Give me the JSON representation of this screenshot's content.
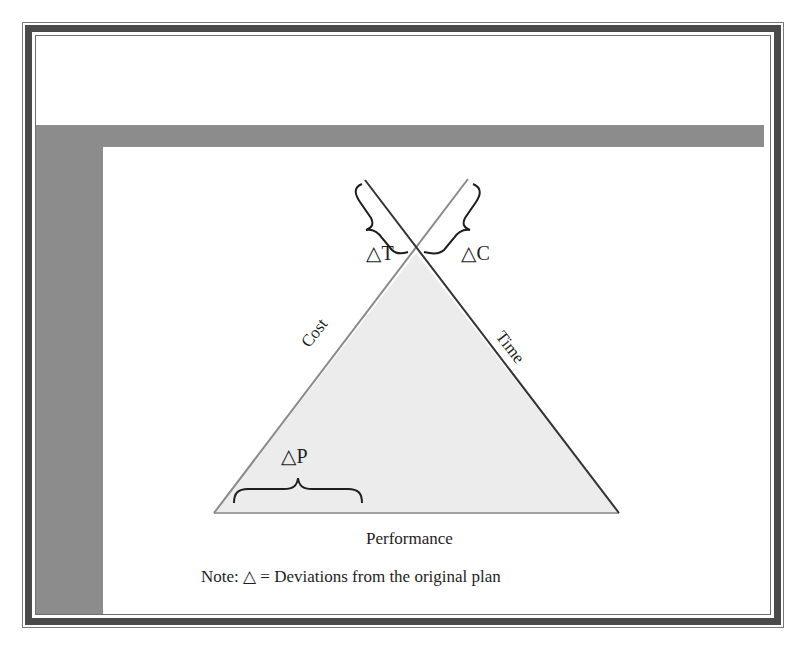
{
  "diagram": {
    "type": "project-triangle",
    "sides": {
      "left": "Cost",
      "right": "Time",
      "base": "Performance"
    },
    "deviations": {
      "time": "△T",
      "cost": "△C",
      "performance": "△P"
    },
    "note": "Note: △ = Deviations from the original plan",
    "colors": {
      "frame_dark": "#4a4a4a",
      "band_gray": "#8c8c8c",
      "triangle_fill": "#ececec",
      "line_dark": "#333333",
      "line_light": "#8a8a8a"
    }
  }
}
